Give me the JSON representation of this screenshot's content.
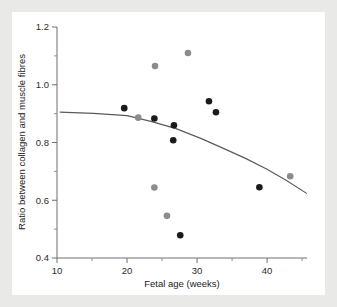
{
  "chart_data": {
    "type": "scatter",
    "title": "",
    "xlabel": "Fetal age (weeks)",
    "ylabel": "Ratio between collagen and muscle fibres",
    "xlim": [
      10,
      45.7
    ],
    "ylim": [
      0.4,
      1.2
    ],
    "grid": false,
    "legend": "none",
    "x_major_ticks": [
      10,
      20,
      30,
      40
    ],
    "x_minor_ticks": [
      15,
      25,
      35,
      45
    ],
    "x_tick_labels": [
      "10",
      "20",
      "30",
      "40"
    ],
    "y_major_ticks": [
      0.4,
      0.6,
      0.8,
      1.0,
      1.2
    ],
    "y_minor_ticks": [
      0.5,
      0.7,
      0.9,
      1.1
    ],
    "y_tick_labels": [
      "0.4",
      "0.6",
      "0.8",
      "1.0",
      "1.2"
    ],
    "marker_colors": {
      "black": "#1a1a1a",
      "grey": "#8c8c8c"
    },
    "series": [
      {
        "name": "black markers",
        "color": "#1a1a1a",
        "points": [
          {
            "x": 19.6,
            "y": 0.919
          },
          {
            "x": 23.9,
            "y": 0.883
          },
          {
            "x": 26.7,
            "y": 0.86
          },
          {
            "x": 26.6,
            "y": 0.808
          },
          {
            "x": 27.6,
            "y": 0.479
          },
          {
            "x": 31.7,
            "y": 0.943
          },
          {
            "x": 32.7,
            "y": 0.905
          },
          {
            "x": 38.9,
            "y": 0.645
          }
        ]
      },
      {
        "name": "grey markers",
        "color": "#8c8c8c",
        "points": [
          {
            "x": 21.6,
            "y": 0.886
          },
          {
            "x": 24.0,
            "y": 1.065
          },
          {
            "x": 23.9,
            "y": 0.644
          },
          {
            "x": 25.7,
            "y": 0.546
          },
          {
            "x": 28.7,
            "y": 1.11
          },
          {
            "x": 43.3,
            "y": 0.683
          }
        ]
      }
    ],
    "fit_line": {
      "name": "fitted quadratic trend",
      "color": "#5a5a5a",
      "points": [
        {
          "x": 10.4,
          "y": 0.905
        },
        {
          "x": 20.0,
          "y": 0.893
        },
        {
          "x": 27.0,
          "y": 0.848
        },
        {
          "x": 34.0,
          "y": 0.777
        },
        {
          "x": 40.0,
          "y": 0.707
        },
        {
          "x": 45.7,
          "y": 0.623
        }
      ]
    }
  },
  "axis": {
    "x_title": "Fetal age (weeks)",
    "y_title": "Ratio between collagen and muscle fibres"
  }
}
